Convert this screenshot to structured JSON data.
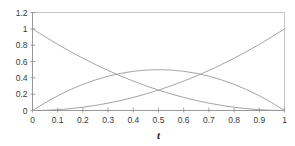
{
  "chart_data": {
    "type": "line",
    "title": "",
    "xlabel": "t",
    "ylabel": "",
    "xlim": [
      0,
      1
    ],
    "ylim": [
      0,
      1.2
    ],
    "grid": false,
    "legend": "none",
    "background_color": "#ffffff",
    "line_color": "#9a9a9a",
    "frame_color": "#b9b9b9",
    "axis_color": "#8d8d8d",
    "xticks": [
      0,
      0.1,
      0.2,
      0.3,
      0.4,
      0.5,
      0.6,
      0.7,
      0.8,
      0.9,
      1
    ],
    "xtick_labels": [
      "0",
      "0.1",
      "0.2",
      "0.3",
      "0.4",
      "0.5",
      "0.6",
      "0.7",
      "0.8",
      "0.9",
      "1"
    ],
    "yticks": [
      0,
      0.2,
      0.4,
      0.6,
      0.8,
      1,
      1.2
    ],
    "ytick_labels": [
      "0",
      "0.2",
      "0.4",
      "0.6",
      "0.8",
      "1",
      "1.2"
    ],
    "x": [
      0,
      0.05,
      0.1,
      0.15,
      0.2,
      0.25,
      0.3,
      0.35,
      0.4,
      0.45,
      0.5,
      0.55,
      0.6,
      0.65,
      0.7,
      0.75,
      0.8,
      0.85,
      0.9,
      0.95,
      1
    ],
    "series": [
      {
        "name": "(1-t)^2",
        "values": [
          1,
          0.9025,
          0.81,
          0.7225,
          0.64,
          0.5625,
          0.49,
          0.4225,
          0.36,
          0.3025,
          0.25,
          0.2025,
          0.16,
          0.1225,
          0.09,
          0.0625,
          0.04,
          0.0225,
          0.01,
          0.0025,
          0
        ]
      },
      {
        "name": "2t(1-t)",
        "values": [
          0,
          0.095,
          0.18,
          0.255,
          0.32,
          0.375,
          0.42,
          0.455,
          0.48,
          0.495,
          0.5,
          0.495,
          0.48,
          0.455,
          0.42,
          0.375,
          0.32,
          0.255,
          0.18,
          0.095,
          0
        ]
      },
      {
        "name": "t^2",
        "values": [
          0,
          0.0025,
          0.01,
          0.0225,
          0.04,
          0.0625,
          0.09,
          0.1225,
          0.16,
          0.2025,
          0.25,
          0.3025,
          0.36,
          0.4225,
          0.49,
          0.5625,
          0.64,
          0.7225,
          0.81,
          0.9025,
          1
        ]
      }
    ]
  }
}
